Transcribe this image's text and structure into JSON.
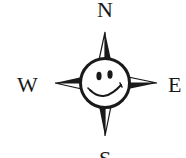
{
  "compass": {
    "north": "N",
    "south": "S",
    "west": "W",
    "east": "E",
    "center_icon": "smiley-face-icon",
    "stroke_color": "#1a1a1a",
    "background_color": "#ffffff"
  }
}
